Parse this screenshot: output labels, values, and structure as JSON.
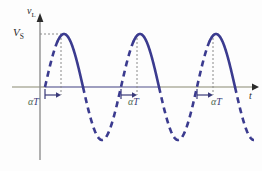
{
  "figure": {
    "background_color": "#fdfdfd"
  },
  "axes": {
    "y_axis": {
      "label_main": "v",
      "label_sub": "L",
      "color": "#8a8a8a",
      "arrow_color": "#2b2b2b"
    },
    "x_axis": {
      "label": "t",
      "color": "#8a8a72",
      "arrow_color": "#2b2b2b"
    }
  },
  "markers": {
    "peak_label_main": "V",
    "peak_label_sub": "S",
    "alpha_labels": [
      {
        "alpha": "α",
        "t": "T"
      },
      {
        "alpha": "α",
        "t": "T"
      },
      {
        "alpha": "α",
        "t": "T"
      }
    ],
    "guide_color": "#777777"
  },
  "colors": {
    "waveform": "#3b3b8f",
    "waveform_dashed": "#3b3b8f",
    "axis_olive": "#8a8a72",
    "axis_blue": "#6b6bc0",
    "alpha_text": "#3a3a7a",
    "alpha_green": "#4d6b4d",
    "label_text": "#2b2b2b",
    "dotted_guide": "#888888"
  },
  "chart_data": {
    "type": "line",
    "title": "",
    "xlabel": "t",
    "ylabel": "v_L",
    "grid": false,
    "legend": null,
    "amplitude_label": "V_S",
    "firing_angle_label": "αT",
    "periods_shown": 3,
    "axis_zero_y": 87,
    "x_range_px": [
      45,
      258
    ],
    "series": [
      {
        "name": "v_L",
        "function": "V_S * sin(2*pi*(x - x0)/T)",
        "x0_px": 45,
        "period_px": 76,
        "amplitude_px": 53,
        "peak_value_label": "V_S",
        "solid_segments_deg": [
          [
            60,
            180
          ],
          [
            420,
            540
          ],
          [
            780,
            900
          ]
        ],
        "dashed_segments_deg": [
          [
            0,
            60
          ],
          [
            180,
            420
          ],
          [
            540,
            780
          ],
          [
            900,
            990
          ]
        ]
      }
    ],
    "annotations": [
      {
        "text": "V_S",
        "type": "y-value-label",
        "x_px": 14,
        "y_px": 27
      },
      {
        "text": "αT",
        "type": "interval-label",
        "x_px": 28,
        "y_px": 97
      },
      {
        "text": "αT",
        "type": "interval-label",
        "x_px": 128,
        "y_px": 97
      },
      {
        "text": "αT",
        "type": "interval-label",
        "x_px": 211,
        "y_px": 97
      },
      {
        "text": "t",
        "type": "axis-label",
        "x_px": 249,
        "y_px": 91
      },
      {
        "text": "v_L",
        "type": "axis-label",
        "x_px": 27,
        "y_px": 6
      }
    ],
    "firing_angle_deg": 60,
    "peaks_px": [
      [
        61,
        34
      ],
      [
        137,
        34
      ],
      [
        213,
        34
      ]
    ],
    "zero_crossings_px": [
      45,
      83,
      121,
      159,
      197,
      235
    ],
    "troughs_px": [
      [
        99,
        140
      ],
      [
        175,
        140
      ],
      [
        251,
        140
      ]
    ]
  }
}
